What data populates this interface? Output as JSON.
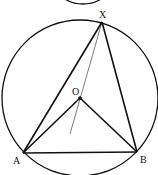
{
  "diagram": {
    "type": "circle-geometry",
    "colors": {
      "stroke": "#111111",
      "thin_line": "#444444",
      "background": "#ffffff"
    },
    "circle": {
      "cx": 80,
      "cy": 98,
      "r": 78
    },
    "top_fragment": {
      "cx": 83,
      "cy": -8,
      "rx": 22,
      "ry": 12
    },
    "points": {
      "X": {
        "label": "X",
        "x": 102,
        "y": 22
      },
      "O": {
        "label": "O",
        "x": 80,
        "y": 98
      },
      "A": {
        "label": "A",
        "x": 23,
        "y": 153
      },
      "B": {
        "label": "B",
        "x": 137,
        "y": 152
      }
    },
    "segments": [
      "XA",
      "XB",
      "AB",
      "OA",
      "OB"
    ],
    "thin_line": {
      "from": "X",
      "through": "O",
      "end": {
        "x": 70,
        "y": 134
      }
    }
  }
}
